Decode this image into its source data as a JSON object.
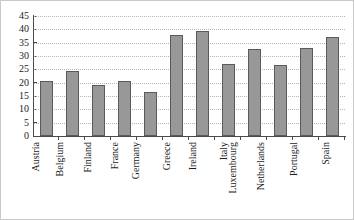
{
  "chart_data": {
    "type": "bar",
    "title": "",
    "subtitle": "",
    "xlabel": "",
    "ylabel": "",
    "ylim": [
      0,
      45
    ],
    "yticks": [
      0,
      5,
      10,
      15,
      20,
      25,
      30,
      35,
      40,
      45
    ],
    "grid": true,
    "legend": false,
    "legend_position": "none",
    "series_name": "",
    "bar_color": "#989898",
    "bar_edge_color": "#5a5a5a",
    "gridline_color": "#b5b5b5",
    "axis_color": "#4a4a4a",
    "categories": [
      "Austria",
      "Belgium",
      "Finland",
      "France",
      "Germany",
      "Greece",
      "Ireland",
      "Italy",
      "Luxembourg",
      "Netherlands",
      "Portugal",
      "Spain"
    ],
    "values": [
      20.5,
      24.5,
      19,
      20.5,
      16.5,
      38,
      39.5,
      27,
      32.5,
      26.5,
      33,
      37
    ]
  }
}
